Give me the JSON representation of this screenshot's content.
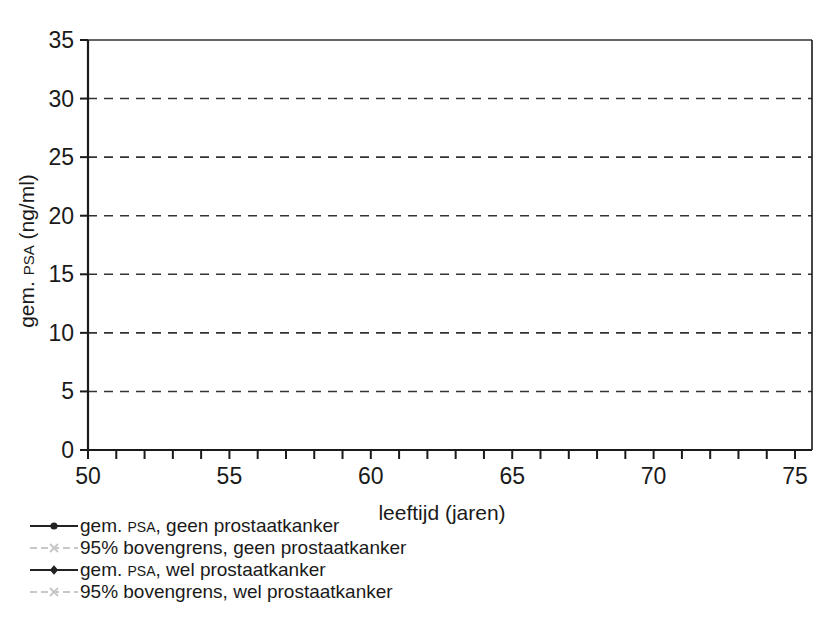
{
  "chart_data": {
    "type": "line",
    "title": "",
    "xlabel": "leeftijd (jaren)",
    "ylabel_main": "gem.",
    "ylabel_smallcaps": "PSA",
    "ylabel_unit": "(ng/ml)",
    "ylabel_full": "gem. PSA (ng/ml)",
    "xlim": [
      50,
      75.6
    ],
    "ylim": [
      0,
      35
    ],
    "xticks": [
      50,
      51,
      52,
      53,
      54,
      55,
      56,
      57,
      58,
      59,
      60,
      61,
      62,
      63,
      64,
      65,
      66,
      67,
      68,
      69,
      70,
      71,
      72,
      73,
      74,
      75
    ],
    "xtick_labels": [
      "50",
      "",
      "",
      "",
      "",
      "55",
      "",
      "",
      "",
      "",
      "60",
      "",
      "",
      "",
      "",
      "65",
      "",
      "",
      "",
      "",
      "70",
      "",
      "",
      "",
      "",
      "75"
    ],
    "xtick_labels_shown": [
      "50",
      "55",
      "60",
      "65",
      "70",
      "75"
    ],
    "yticks": [
      0,
      5,
      10,
      15,
      20,
      25,
      30,
      35
    ],
    "ytick_labels": [
      "0",
      "5",
      "10",
      "15",
      "20",
      "25",
      "30",
      "35"
    ],
    "grid": "horizontal-dashed",
    "grid_color": "#333333",
    "legend_position": "below-left",
    "series": [
      {
        "name": "gem. PSA, geen prostaatkanker",
        "name_prefix": "gem.",
        "name_smallcaps": "PSA,",
        "name_suffix": "geen prostaatkanker",
        "color": "#222222",
        "marker": "circle",
        "linestyle": "solid",
        "x": [
          54.2,
          55.2,
          56.2,
          57.2,
          58.2,
          59.2,
          60.2,
          61.2,
          62.2,
          63.2,
          64.2,
          65.2,
          66.2,
          67.2,
          68.2,
          69.2,
          70.2,
          71.2,
          72.2,
          73.2,
          74.2,
          75.3
        ],
        "values": [
          1.55,
          1.6,
          1.65,
          1.8,
          1.9,
          1.9,
          1.9,
          1.95,
          2.2,
          2.2,
          2.4,
          2.6,
          2.95,
          2.8,
          2.85,
          3.0,
          3.2,
          3.15,
          3.1,
          3.5,
          3.9,
          4.35
        ]
      },
      {
        "name": "95% bovengrens, geen prostaatkanker",
        "color": "#c8c8c8",
        "marker": "x",
        "linestyle": "dashed",
        "x": [
          54.2,
          55.2,
          56.2,
          57.2,
          58.2,
          59.2,
          60.2,
          61.2,
          62.2,
          63.2,
          64.2,
          65.2,
          66.2,
          67.2,
          68.2,
          69.2,
          70.2,
          71.2,
          72.2,
          73.2,
          74.2,
          75.3
        ],
        "values": [
          1.6,
          1.7,
          1.75,
          1.9,
          2.0,
          2.0,
          2.0,
          2.1,
          2.4,
          2.4,
          2.6,
          2.8,
          3.2,
          3.0,
          3.1,
          3.2,
          3.4,
          3.35,
          3.3,
          4.0,
          5.1,
          6.0
        ]
      },
      {
        "name": "gem. PSA, wel prostaatkanker",
        "name_prefix": "gem.",
        "name_smallcaps": "PSA,",
        "name_suffix": "wel prostaatkanker",
        "color": "#222222",
        "marker": "diamond",
        "linestyle": "solid",
        "x": [
          55.0,
          56.0,
          57.0,
          58.0,
          59.0,
          60.0,
          61.0,
          62.0,
          63.0,
          64.0,
          65.0,
          66.0,
          67.0,
          68.0,
          69.0,
          70.0,
          71.0,
          72.0,
          73.0,
          74.3,
          75.3
        ],
        "values": [
          7.3,
          6.2,
          9.2,
          15.7,
          10.8,
          10.6,
          7.4,
          10.7,
          10.9,
          11.7,
          11.8,
          20.7,
          14.9,
          22.3,
          16.0,
          27.2,
          16.0,
          14.0,
          17.3,
          28.6,
          20.6
        ]
      },
      {
        "name": "95% bovengrens, wel prostaatkanker",
        "color": "#c8c8c8",
        "marker": "x",
        "linestyle": "dashed",
        "x": [
          55.0,
          56.0,
          57.0,
          58.0,
          59.0,
          60.0,
          61.0,
          62.0,
          63.0,
          64.0,
          65.0,
          66.0,
          67.0,
          68.0,
          69.0,
          70.0,
          71.0,
          72.0,
          73.0,
          74.3,
          75.3
        ],
        "values": [
          6.0,
          5.1,
          7.6,
          10.1,
          8.6,
          7.5,
          6.2,
          8.4,
          8.7,
          9.4,
          9.4,
          12.1,
          10.8,
          13.0,
          10.9,
          15.6,
          10.7,
          10.6,
          11.5,
          15.0,
          12.3
        ]
      }
    ]
  },
  "legend": {
    "items": [
      {
        "label": "gem. PSA, geen prostaatkanker",
        "prefix": "gem. ",
        "smallcaps": "PSA",
        "suffix": ", geen prostaatkanker",
        "key": "dark-circle-line"
      },
      {
        "label": "95% bovengrens, geen prostaatkanker",
        "prefix": "95% bovengrens, geen prostaatkanker",
        "smallcaps": "",
        "suffix": "",
        "key": "light-x-dashed"
      },
      {
        "label": "gem. PSA, wel prostaatkanker",
        "prefix": "gem. ",
        "smallcaps": "PSA",
        "suffix": ", wel prostaatkanker",
        "key": "dark-diamond-line"
      },
      {
        "label": "95% bovengrens, wel prostaatkanker",
        "prefix": "95% bovengrens, wel prostaatkanker",
        "smallcaps": "",
        "suffix": "",
        "key": "light-x-dashed"
      }
    ]
  },
  "colors": {
    "series_dark": "#222222",
    "series_light": "#c8c8c8",
    "axis": "#1a1a1a",
    "grid": "#333333",
    "background": "#ffffff"
  }
}
